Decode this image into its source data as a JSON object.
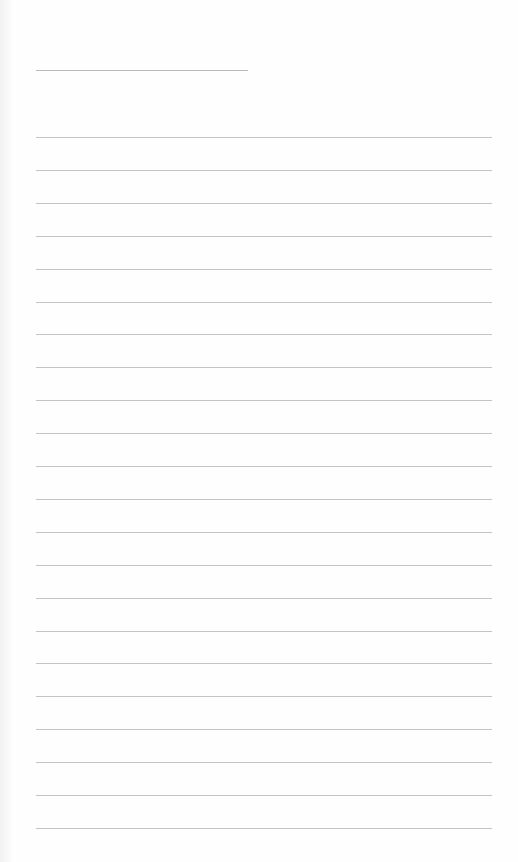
{
  "paper": {
    "type": "lined-writing-page",
    "title_line": {
      "present": true,
      "text": ""
    },
    "rule_count": 22,
    "rule_color": "#c4c4c4",
    "lines": [
      "",
      "",
      "",
      "",
      "",
      "",
      "",
      "",
      "",
      "",
      "",
      "",
      "",
      "",
      "",
      "",
      "",
      "",
      "",
      "",
      "",
      ""
    ]
  }
}
